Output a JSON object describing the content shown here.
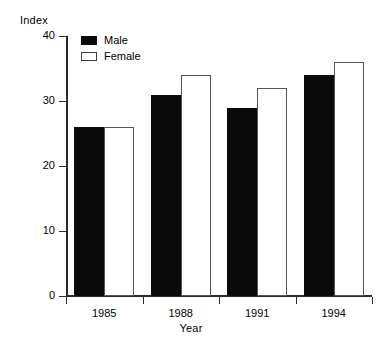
{
  "chart_data": {
    "type": "bar",
    "title": "",
    "subtitle": "",
    "xlabel": "Year",
    "ylabel": "Index",
    "categories": [
      "1985",
      "1988",
      "1991",
      "1994"
    ],
    "series": [
      {
        "name": "Male",
        "values": [
          26,
          31,
          29,
          34
        ],
        "color": "#000000"
      },
      {
        "name": "Female",
        "values": [
          26,
          34,
          32,
          36
        ],
        "color": "#ffffff"
      }
    ],
    "ylim": [
      0,
      40
    ],
    "yticks": [
      0,
      10,
      20,
      30,
      40
    ],
    "ytick_labels": [
      "0",
      "10",
      "20",
      "30",
      "40"
    ],
    "grid": false,
    "legend_position": "top-left-inside",
    "legend_entries": [
      "Male",
      "Female"
    ],
    "annotations": []
  }
}
